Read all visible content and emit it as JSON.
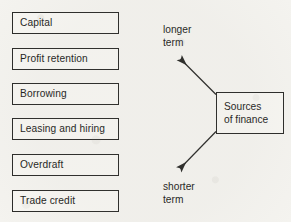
{
  "diagram": {
    "title": "Sources of finance",
    "type": "flow-diagram",
    "background_color": "#f4f3ef",
    "line_color": "#2a2a28",
    "text_color": "#1d1d1b",
    "sources": [
      {
        "label": "Capital"
      },
      {
        "label": "Profit retention"
      },
      {
        "label": "Borrowing"
      },
      {
        "label": "Leasing and hiring"
      },
      {
        "label": "Overdraft"
      },
      {
        "label": "Trade credit"
      }
    ],
    "hub": {
      "line1": "Sources",
      "line2": "of finance"
    },
    "terms": {
      "longer": {
        "line1": "longer",
        "line2": "term"
      },
      "shorter": {
        "line1": "shorter",
        "line2": "term"
      }
    },
    "arrows": {
      "longer_term": {
        "name": "arrow-to-longer-term",
        "direction": "up-left"
      },
      "shorter_term": {
        "name": "arrow-to-shorter-term",
        "direction": "down-left"
      }
    }
  }
}
